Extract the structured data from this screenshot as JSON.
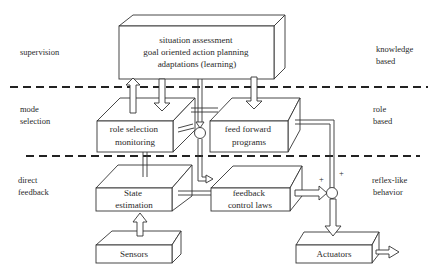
{
  "layers": {
    "left": [
      {
        "lines": [
          "supervision"
        ]
      },
      {
        "lines": [
          "mode",
          "selection"
        ]
      },
      {
        "lines": [
          "direct",
          "feedback"
        ]
      }
    ],
    "right": [
      {
        "lines": [
          "knowledge",
          "based"
        ]
      },
      {
        "lines": [
          "role",
          "based"
        ]
      },
      {
        "lines": [
          "reflex-like",
          "behavior"
        ]
      }
    ]
  },
  "blocks": {
    "supervisor": {
      "lines": [
        "situation assessment",
        "goal oriented action planning",
        "adaptations (learning)"
      ]
    },
    "role_selection": {
      "lines": [
        "role selection",
        "monitoring"
      ]
    },
    "feed_forward": {
      "lines": [
        "feed forward",
        "programs"
      ]
    },
    "state_estimation": {
      "lines": [
        "State",
        "estimation"
      ]
    },
    "feedback_control": {
      "lines": [
        "feedback",
        "control laws"
      ]
    },
    "sensors": {
      "lines": [
        "Sensors"
      ]
    },
    "actuators": {
      "lines": [
        "Actuators"
      ]
    }
  },
  "summing_junction": {
    "plus_top": "+",
    "plus_left": "+"
  },
  "colors": {
    "line": "#333333",
    "background": "#ffffff"
  }
}
